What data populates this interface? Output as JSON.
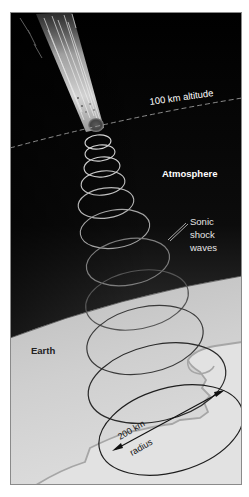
{
  "diagram": {
    "type": "illustration",
    "labels": {
      "altitude": "100 km altitude",
      "atmosphere": "Atmosphere",
      "sonic_line1": "Sonic",
      "sonic_line2": "shock",
      "sonic_line3": "waves",
      "earth": "Earth",
      "radius_value": "200 km",
      "radius_word": "radius"
    },
    "colors": {
      "space": "#000000",
      "atmosphere_bottom": "#7a7a7a",
      "earth_surface": "#c9c9c9",
      "earth_light": "#e4e4e4",
      "coastline": "#a8a8a8",
      "wave_light": "#d8d8d8",
      "wave_dark": "#2a2a2a",
      "label_light": "#ffffff",
      "label_dark": "#222222",
      "frame": "#888888"
    },
    "shock_waves": [
      {
        "cx": 98,
        "cy": 142,
        "rx": 13,
        "ry": 7,
        "rot": -6,
        "stroke": "#d6d6d6"
      },
      {
        "cx": 100,
        "cy": 153,
        "rx": 15,
        "ry": 8,
        "rot": -6,
        "stroke": "#d2d2d2"
      },
      {
        "cx": 102,
        "cy": 167,
        "rx": 18,
        "ry": 10,
        "rot": -6,
        "stroke": "#cccccc"
      },
      {
        "cx": 103,
        "cy": 183,
        "rx": 22,
        "ry": 12,
        "rot": -7,
        "stroke": "#c4c4c4"
      },
      {
        "cx": 106,
        "cy": 203,
        "rx": 28,
        "ry": 15,
        "rot": -8,
        "stroke": "#b8b8b8"
      },
      {
        "cx": 115,
        "cy": 229,
        "rx": 35,
        "ry": 19,
        "rot": -9,
        "stroke": "#a4a4a4"
      },
      {
        "cx": 128,
        "cy": 262,
        "rx": 42,
        "ry": 23,
        "rot": -10,
        "stroke": "#7e7e7e"
      },
      {
        "cx": 137,
        "cy": 300,
        "rx": 52,
        "ry": 29,
        "rot": -11,
        "stroke": "#555555"
      },
      {
        "cx": 145,
        "cy": 340,
        "rx": 59,
        "ry": 33,
        "rot": -12,
        "stroke": "#3a3a3a"
      },
      {
        "cx": 157,
        "cy": 383,
        "rx": 70,
        "ry": 38,
        "rot": -13,
        "stroke": "#2a2a2a"
      },
      {
        "cx": 171,
        "cy": 430,
        "rx": 74,
        "ry": 42,
        "rot": -16,
        "stroke": "#1e1e1e"
      }
    ]
  }
}
